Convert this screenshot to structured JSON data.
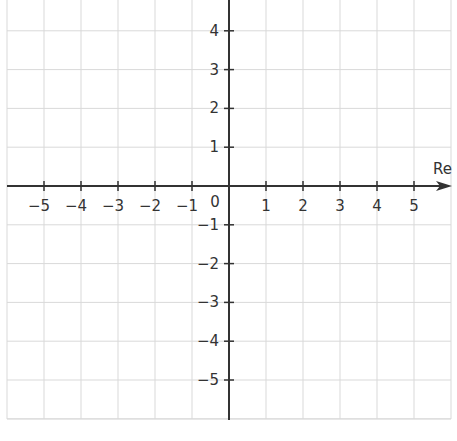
{
  "chart_data": {
    "type": "scatter",
    "title": "",
    "xlabel": "Re",
    "ylabel": "",
    "xlim": [
      -6,
      6
    ],
    "ylim": [
      -6,
      4.8
    ],
    "grid": true,
    "origin_label": "0",
    "x_ticks": [
      -5,
      -4,
      -3,
      -2,
      -1,
      1,
      2,
      3,
      4,
      5
    ],
    "x_tick_labels": [
      "−5",
      "−4",
      "−3",
      "−2",
      "−1",
      "1",
      "2",
      "3",
      "4",
      "5"
    ],
    "y_ticks": [
      4,
      3,
      2,
      1,
      -1,
      -2,
      -3,
      -4,
      -5
    ],
    "y_tick_labels": [
      "4",
      "3",
      "2",
      "1",
      "−1",
      "−2",
      "−3",
      "−4",
      "−5"
    ],
    "series": []
  },
  "colors": {
    "axis": "#333333",
    "grid": "#d9d9d9",
    "text": "#333333"
  }
}
